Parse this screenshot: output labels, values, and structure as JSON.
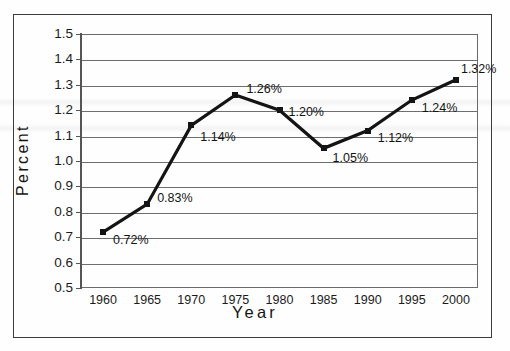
{
  "figure": {
    "background_color": "#fefefe",
    "frame_color": "#3c3c3c",
    "line_color": "#141414",
    "grid_color": "#6e6e6e"
  },
  "chart_data": {
    "type": "line",
    "title": "",
    "subtitle": "",
    "xlabel": "Year",
    "ylabel": "Percent",
    "x": [
      1960,
      1965,
      1970,
      1975,
      1980,
      1985,
      1990,
      1995,
      2000
    ],
    "categories": [
      "1960",
      "1965",
      "1970",
      "1975",
      "1980",
      "1985",
      "1990",
      "1995",
      "2000"
    ],
    "values": [
      0.72,
      0.83,
      1.14,
      1.26,
      1.2,
      1.05,
      1.12,
      1.24,
      1.32
    ],
    "point_labels": [
      "0.72%",
      "0.83%",
      "1.14%",
      "1.26%",
      "1.20%",
      "1.05%",
      "1.12%",
      "1.24%",
      "1.32%"
    ],
    "ylim": [
      0.5,
      1.5
    ],
    "xlim": [
      1957.5,
      2002.5
    ],
    "ytick_labels": [
      "1.5",
      "1.4",
      "1.3",
      "1.2",
      "1.1",
      "1.0",
      "0.9",
      "0.8",
      "0.7",
      "0.6",
      "0.5"
    ],
    "ytick_values": [
      1.5,
      1.4,
      1.3,
      1.2,
      1.1,
      1.0,
      0.9,
      0.8,
      0.7,
      0.6,
      0.5
    ],
    "xtick_labels": [
      "1960",
      "1965",
      "1970",
      "1975",
      "1980",
      "1985",
      "1990",
      "1995",
      "2000"
    ],
    "grid": "horizontal",
    "legend": "none",
    "marker": "square",
    "series": [
      {
        "name": "Percent",
        "values": [
          0.72,
          0.83,
          1.14,
          1.26,
          1.2,
          1.05,
          1.12,
          1.24,
          1.32
        ]
      }
    ]
  }
}
